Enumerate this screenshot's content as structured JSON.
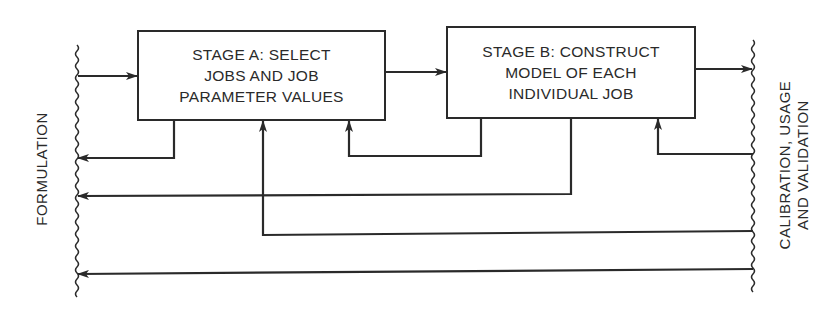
{
  "diagram": {
    "left_boundary_label": "FORMULATION",
    "right_boundary_label": "CALIBRATION, USAGE\nAND VALIDATION",
    "stages": [
      {
        "id": "stage-a",
        "label": "STAGE A: SELECT\nJOBS AND JOB\nPARAMETER VALUES"
      },
      {
        "id": "stage-b",
        "label": "STAGE B: CONSTRUCT\nMODEL OF EACH\nINDIVIDUAL JOB"
      }
    ],
    "flows": [
      {
        "from": "formulation",
        "to": "stage-a",
        "type": "forward"
      },
      {
        "from": "stage-a",
        "to": "stage-b",
        "type": "forward"
      },
      {
        "from": "stage-b",
        "to": "calibration-usage-validation",
        "type": "forward"
      },
      {
        "from": "stage-a",
        "to": "formulation",
        "type": "feedback"
      },
      {
        "from": "stage-b",
        "to": "stage-a",
        "type": "feedback"
      },
      {
        "from": "stage-b",
        "to": "formulation",
        "type": "feedback"
      },
      {
        "from": "calibration-usage-validation",
        "to": "stage-b",
        "type": "feedback"
      },
      {
        "from": "calibration-usage-validation",
        "to": "stage-a",
        "type": "feedback"
      },
      {
        "from": "calibration-usage-validation",
        "to": "formulation",
        "type": "feedback"
      }
    ],
    "colors": {
      "line": "#2a2a2a",
      "background": "#ffffff"
    }
  }
}
